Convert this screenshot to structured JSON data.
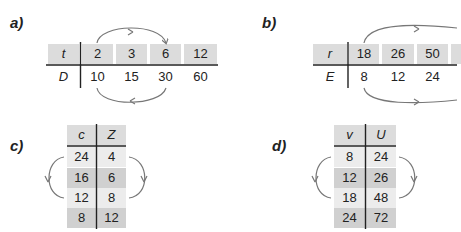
{
  "panels": {
    "a": {
      "label": "a)",
      "orientation": "horizontal",
      "row1": {
        "var": "t",
        "values": [
          "2",
          "3",
          "6",
          "12"
        ]
      },
      "row2": {
        "var": "D",
        "values": [
          "10",
          "15",
          "30",
          "60"
        ]
      },
      "arrows": "top: 2 → 6; bottom: 10 → 30"
    },
    "b": {
      "label": "b)",
      "orientation": "horizontal",
      "row1": {
        "var": "r",
        "values": [
          "18",
          "26",
          "50"
        ]
      },
      "row2": {
        "var": "E",
        "values": [
          "8",
          "12",
          "24"
        ]
      },
      "note": "table continues beyond right edge (4th column cut off)",
      "arrows": "top: 18 → (cut off); bottom: 8 → (cut off)"
    },
    "c": {
      "label": "c)",
      "orientation": "vertical",
      "col1": {
        "var": "c",
        "values": [
          "24",
          "16",
          "12",
          "8"
        ]
      },
      "col2": {
        "var": "Z",
        "values": [
          "4",
          "6",
          "8",
          "12"
        ]
      },
      "arrows": "left: 24 → 12; right: 4 → 8"
    },
    "d": {
      "label": "d)",
      "orientation": "vertical",
      "col1": {
        "var": "v",
        "values": [
          "8",
          "12",
          "18",
          "24"
        ]
      },
      "col2": {
        "var": "U",
        "values": [
          "24",
          "26",
          "48",
          "72"
        ]
      },
      "arrows": "left: 8 → 18; right: 24 → 48"
    }
  },
  "colors": {
    "header_fill": "#dcdcdc",
    "light_fill": "#ececec",
    "dark_fill": "#d0d0d0",
    "rule": "#222222",
    "arrow": "#777777"
  }
}
